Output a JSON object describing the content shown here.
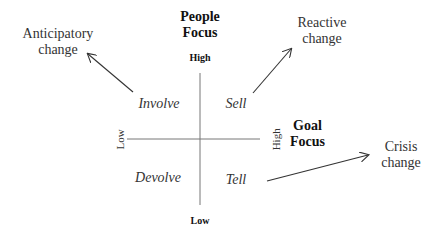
{
  "axes": {
    "y_title": [
      "People",
      "Focus"
    ],
    "x_title": [
      "Goal",
      "Focus"
    ],
    "y_high": "High",
    "y_low": "Low",
    "x_low": "Low",
    "x_high": "High"
  },
  "quadrants": {
    "top_left": "Involve",
    "top_right": "Sell",
    "bottom_left": "Devolve",
    "bottom_right": "Tell"
  },
  "outcomes": {
    "anticipatory": [
      "Anticipatory",
      "change"
    ],
    "reactive": [
      "Reactive",
      "change"
    ],
    "crisis": [
      "Crisis",
      "change"
    ]
  },
  "colors": {
    "line": "#555555",
    "text": "#222222"
  }
}
